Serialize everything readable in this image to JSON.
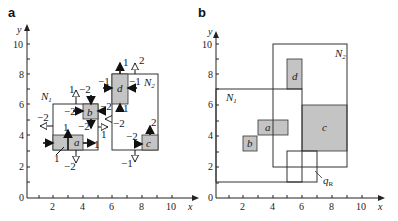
{
  "panels": [
    {
      "id": "a",
      "label": "a",
      "x_axis_label": "x",
      "y_axis_label": "y",
      "x_ticks": [
        "2",
        "4",
        "6",
        "8",
        "10"
      ],
      "y_ticks": [
        "0",
        "2",
        "4",
        "6",
        "8",
        "10"
      ],
      "regions": [
        {
          "name": "N1",
          "label": "N",
          "sub": "1",
          "x": [
            2,
            5
          ],
          "y": [
            3,
            6
          ]
        },
        {
          "name": "N2",
          "label": "N",
          "sub": "2",
          "x": [
            6,
            9
          ],
          "y": [
            3,
            8
          ]
        }
      ],
      "cells": [
        {
          "name": "a",
          "label": "a",
          "x": [
            2,
            4
          ],
          "y": [
            3,
            4
          ]
        },
        {
          "name": "b",
          "label": "b",
          "x": [
            4,
            5
          ],
          "y": [
            5,
            6
          ]
        },
        {
          "name": "c",
          "label": "c",
          "x": [
            8,
            9
          ],
          "y": [
            3,
            4
          ]
        },
        {
          "name": "d",
          "label": "d",
          "x": [
            6,
            7
          ],
          "y": [
            6,
            8
          ]
        }
      ],
      "force_labels": {
        "n1_top": "1",
        "n1_top2": "−2",
        "b_left": "−2",
        "b_right": "−2",
        "b_bottom": "−2",
        "n1_left": "−2",
        "n1_right": "1",
        "a_up": "1",
        "a_right": "1",
        "a_diag": "1",
        "n1_bottom": "−2",
        "d_up": "1",
        "d_left": "−1",
        "d_right": "−1",
        "d_down": "1",
        "n2_top": "2",
        "n2_left": "−2",
        "c_up": "2",
        "c_left": "−2",
        "n2_bottom": "−1"
      }
    },
    {
      "id": "b",
      "label": "b",
      "x_axis_label": "x",
      "y_axis_label": "y",
      "x_ticks": [
        "2",
        "4",
        "6",
        "8",
        "10"
      ],
      "y_ticks": [
        "0",
        "2",
        "4",
        "6",
        "8",
        "10"
      ],
      "regions": [
        {
          "name": "N1",
          "label": "N",
          "sub": "1",
          "x": [
            0,
            6
          ],
          "y": [
            1,
            7
          ]
        },
        {
          "name": "N2",
          "label": "N",
          "sub": "2",
          "x": [
            4,
            9
          ],
          "y": [
            2,
            10
          ]
        },
        {
          "name": "qR",
          "label": "q",
          "sub": "R",
          "x": [
            5,
            7
          ],
          "y": [
            1,
            3
          ]
        }
      ],
      "cells": [
        {
          "name": "a",
          "label": "a",
          "x": [
            3,
            5
          ],
          "y": [
            4,
            5
          ]
        },
        {
          "name": "b",
          "label": "b",
          "x": [
            2,
            3
          ],
          "y": [
            3,
            4
          ]
        },
        {
          "name": "c",
          "label": "c",
          "x": [
            6,
            9
          ],
          "y": [
            3,
            6
          ]
        },
        {
          "name": "d",
          "label": "d",
          "x": [
            5,
            6
          ],
          "y": [
            7,
            9
          ]
        }
      ]
    }
  ],
  "colors": {
    "cell_fill": "#c4c4c4",
    "line": "#333333",
    "background": "#ffffff"
  }
}
